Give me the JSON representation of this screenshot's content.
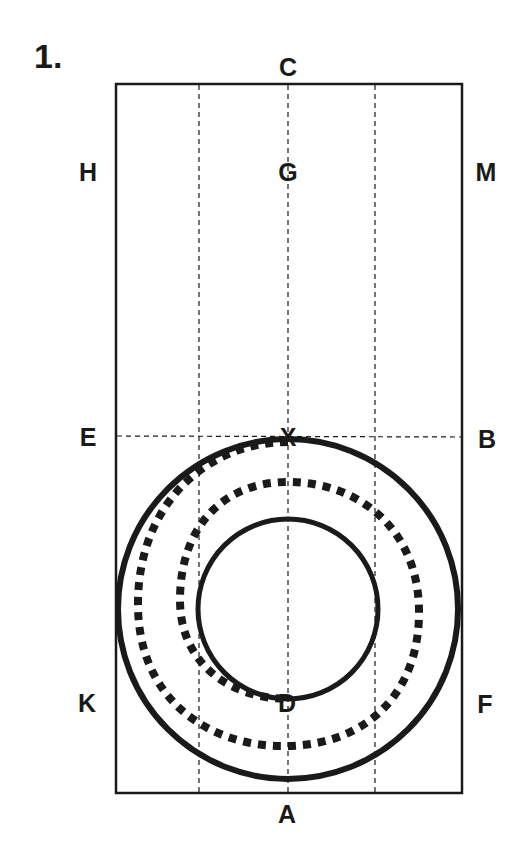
{
  "figure": {
    "number_label": "1.",
    "colors": {
      "ink": "#1a1a1a",
      "background": "#ffffff"
    }
  },
  "labels": {
    "C": "C",
    "G": "G",
    "H": "H",
    "M": "M",
    "E": "E",
    "B": "B",
    "K": "K",
    "F": "F",
    "A": "A",
    "D": "D",
    "X": "X"
  },
  "geometry": {
    "rectangle": {
      "x": 116,
      "y": 84,
      "width": 346,
      "height": 709
    },
    "vertical_dashed_lines_x": [
      199,
      288,
      375
    ],
    "horizontal_dashed_line_y": 436,
    "outer_circle": {
      "cx": 288,
      "cy": 609,
      "r": 170
    },
    "inner_circle": {
      "cx": 288,
      "cy": 609,
      "r": 90
    },
    "dotted_spiral": "from X on outer circle, counter-clockwise inward, ending at D on inner circle"
  }
}
